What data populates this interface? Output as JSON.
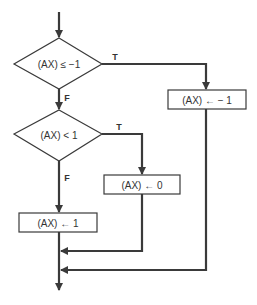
{
  "diagram": {
    "type": "flowchart",
    "line_color": "#3a3a3a",
    "decisions": [
      {
        "id": "d1",
        "label": "(AX) ≤ −1",
        "true_label": "T",
        "false_label": "F"
      },
      {
        "id": "d2",
        "label": "(AX) < 1",
        "true_label": "T",
        "false_label": "F"
      }
    ],
    "processes": [
      {
        "id": "p1",
        "label": "(AX) ← − 1"
      },
      {
        "id": "p2",
        "label": "(AX) ← 0"
      },
      {
        "id": "p3",
        "label": "(AX) ← 1"
      }
    ],
    "edges": [
      {
        "from": "start",
        "to": "d1"
      },
      {
        "from": "d1",
        "to": "p1",
        "label": "T"
      },
      {
        "from": "d1",
        "to": "d2",
        "label": "F"
      },
      {
        "from": "d2",
        "to": "p2",
        "label": "T"
      },
      {
        "from": "d2",
        "to": "p3",
        "label": "F"
      },
      {
        "from": "p3",
        "to": "end"
      },
      {
        "from": "p2",
        "to": "end"
      },
      {
        "from": "p1",
        "to": "end"
      }
    ]
  }
}
